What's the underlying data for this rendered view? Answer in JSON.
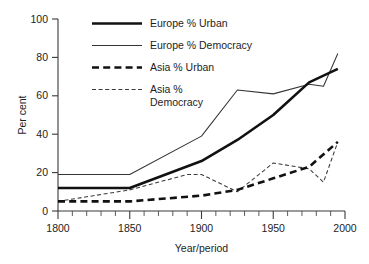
{
  "chart_data": {
    "type": "line",
    "title": "",
    "xlabel": "Year/period",
    "ylabel": "Per cent",
    "xlim": [
      1800,
      2000
    ],
    "ylim": [
      0,
      100
    ],
    "grid": false,
    "legend_position": "top-center",
    "x_ticks": [
      1800,
      1850,
      1900,
      1950,
      2000
    ],
    "x_tick_labels": [
      "1800",
      "1850",
      "1900",
      "1950",
      "2000"
    ],
    "x_minor_tick_step": 10,
    "y_ticks": [
      0,
      20,
      40,
      60,
      80,
      100
    ],
    "y_tick_labels": [
      "0",
      "20",
      "40",
      "60",
      "80",
      "100"
    ],
    "series": [
      {
        "name": "Europe % Urban",
        "style": "thick-solid",
        "x": [
          1800,
          1850,
          1900,
          1925,
          1950,
          1975,
          1995
        ],
        "values": [
          12,
          12,
          26,
          37,
          50,
          67,
          74
        ]
      },
      {
        "name": "Europe % Democracy",
        "style": "thin-solid",
        "x": [
          1800,
          1850,
          1900,
          1925,
          1950,
          1975,
          1985,
          1995
        ],
        "values": [
          19,
          19,
          39,
          63,
          61,
          66,
          65,
          82
        ]
      },
      {
        "name": "Asia % Urban",
        "style": "thick-dashed",
        "x": [
          1800,
          1850,
          1900,
          1925,
          1950,
          1975,
          1995
        ],
        "values": [
          5,
          5,
          8,
          11,
          17,
          23,
          36
        ]
      },
      {
        "name": "Asia % Democracy",
        "style": "thin-dashed",
        "x": [
          1800,
          1850,
          1890,
          1900,
          1925,
          1950,
          1975,
          1985,
          1995
        ],
        "values": [
          5,
          11,
          19,
          19,
          10,
          25,
          22,
          15,
          36
        ]
      }
    ]
  },
  "legend": {
    "items": [
      {
        "label": "Europe % Urban",
        "style": "thick-solid"
      },
      {
        "label": "Europe % Democracy",
        "style": "thin-solid"
      },
      {
        "label": "Asia % Urban",
        "style": "thick-dashed"
      },
      {
        "label": "Asia %",
        "label_line2": "Democracy",
        "style": "thin-dashed"
      }
    ]
  },
  "colors": {
    "ink": "#111111",
    "thin_ink": "#343434",
    "axis": "#3a3a3a",
    "background": "#ffffff"
  }
}
